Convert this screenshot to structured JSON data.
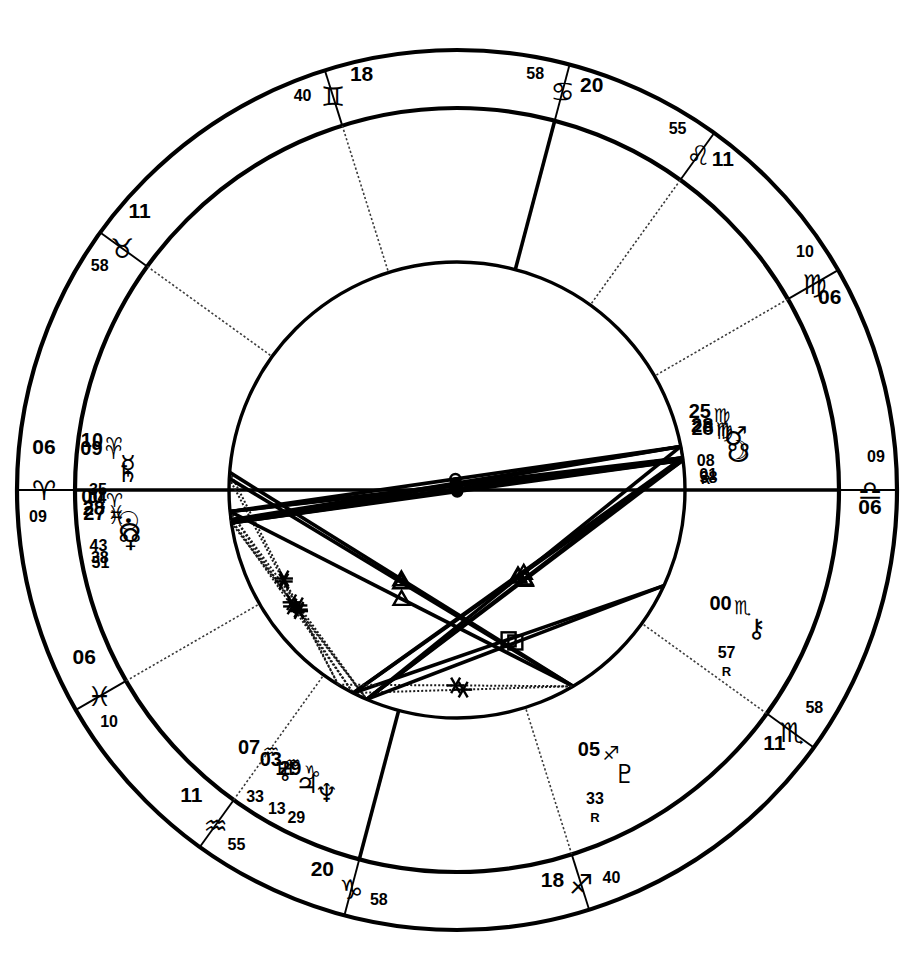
{
  "chart": {
    "type": "astrological-wheel",
    "line_color": "#000000",
    "background": "#ffffff"
  },
  "chart_data": {
    "type": "astrology-wheel",
    "house_cusps": [
      {
        "house": 1,
        "deg": "06",
        "sign": "♎",
        "sign_name": "Libra",
        "min": "09",
        "angle_deg": 186.15,
        "label_pos": "bottom"
      },
      {
        "house": 2,
        "deg": "11",
        "sign": "♏",
        "sign_name": "Scorpio",
        "min": "58",
        "angle_deg": 221.97,
        "label_pos": "bottom-right"
      },
      {
        "house": 3,
        "deg": "18",
        "sign": "♐",
        "sign_name": "Sagittarius",
        "min": "40",
        "angle_deg": 258.67,
        "label_pos": "right-lower"
      },
      {
        "house": 4,
        "deg": "20",
        "sign": "♑",
        "sign_name": "Capricorn",
        "min": "58",
        "angle_deg": 290.97,
        "label_pos": "right"
      },
      {
        "house": 5,
        "deg": "11",
        "sign": "♒",
        "sign_name": "Aquarius",
        "min": "55",
        "angle_deg": 311.92,
        "label_pos": "right-upper"
      },
      {
        "house": 6,
        "deg": "06",
        "sign": "♓",
        "sign_name": "Pisces",
        "min": "10",
        "angle_deg": 336.17,
        "label_pos": "top-right"
      },
      {
        "house": 7,
        "deg": "06",
        "sign": "♈",
        "sign_name": "Aries",
        "min": "09",
        "angle_deg": 6.15,
        "label_pos": "top"
      },
      {
        "house": 8,
        "deg": "11",
        "sign": "♉",
        "sign_name": "Taurus",
        "min": "58",
        "angle_deg": 41.97,
        "label_pos": "top-left"
      },
      {
        "house": 9,
        "deg": "18",
        "sign": "♊",
        "sign_name": "Gemini",
        "min": "40",
        "angle_deg": 78.67,
        "label_pos": "left-upper"
      },
      {
        "house": 10,
        "deg": "20",
        "sign": "♋",
        "sign_name": "Cancer",
        "min": "58",
        "angle_deg": 110.97,
        "label_pos": "left"
      },
      {
        "house": 11,
        "deg": "11",
        "sign": "♌",
        "sign_name": "Leo",
        "min": "55",
        "angle_deg": 131.92,
        "label_pos": "left-lower"
      },
      {
        "house": 12,
        "deg": "06",
        "sign": "♍",
        "sign_name": "Virgo",
        "min": "10",
        "angle_deg": 156.17,
        "label_pos": "bottom-left"
      }
    ],
    "planets": [
      {
        "name": "Mercury",
        "glyph": "☿",
        "deg": "10",
        "sign": "♈",
        "sign_name": "Aries",
        "min": "35",
        "retro": "",
        "lon": 10.58
      },
      {
        "name": "Saturn",
        "glyph": "♄",
        "deg": "09",
        "sign": "♈",
        "sign_name": "Aries",
        "min": "04",
        "retro": "",
        "lon": 9.07
      },
      {
        "name": "Sun",
        "glyph": "☉",
        "deg": "00",
        "sign": "♈",
        "sign_name": "Aries",
        "min": "43",
        "retro": "",
        "lon": 0.72
      },
      {
        "name": "North Node",
        "glyph": "☊",
        "deg": "28",
        "sign": "♓",
        "sign_name": "Pisces",
        "min": "38",
        "retro": "",
        "lon": 358.63
      },
      {
        "name": "Venus",
        "glyph": "♀",
        "deg": "27",
        "sign": "♓",
        "sign_name": "Pisces",
        "min": "51",
        "retro": "",
        "lon": 357.85
      },
      {
        "name": "Jupiter",
        "glyph": "♃",
        "deg": "03",
        "sign": "♒",
        "sign_name": "Aquarius",
        "min": "13",
        "retro": "",
        "lon": 303.22
      },
      {
        "name": "Uranus",
        "glyph": "♅",
        "deg": "07",
        "sign": "♒",
        "sign_name": "Aquarius",
        "min": "33",
        "retro": "",
        "lon": 307.55
      },
      {
        "name": "Neptune",
        "glyph": "♆",
        "deg": "29",
        "sign": "♑",
        "sign_name": "Capricorn",
        "min": "29",
        "retro": "",
        "lon": 299.48
      },
      {
        "name": "Pluto",
        "glyph": "♇",
        "deg": "05",
        "sign": "♐",
        "sign_name": "Sagittarius",
        "min": "33",
        "retro": "R",
        "lon": 245.55
      },
      {
        "name": "Chiron",
        "glyph": "⚷",
        "deg": "00",
        "sign": "♏",
        "sign_name": "Scorpio",
        "min": "57",
        "retro": "R",
        "lon": 210.95
      },
      {
        "name": "Mars",
        "glyph": "♂",
        "deg": "25",
        "sign": "♍",
        "sign_name": "Virgo",
        "min": "08",
        "retro": "R",
        "lon": 175.13
      },
      {
        "name": "South Node",
        "glyph": "☋",
        "deg": "28",
        "sign": "♍",
        "sign_name": "Virgo",
        "min": "38",
        "retro": "",
        "lon": 178.63
      },
      {
        "name": "Moon",
        "glyph": "☽",
        "deg": "28",
        "sign": "♍",
        "sign_name": "Virgo",
        "min": "01",
        "retro": "",
        "lon": 178.02
      }
    ],
    "aspect_glyphs": [
      {
        "name": "conjunction",
        "glyph": "☌"
      },
      {
        "name": "sextile",
        "glyph": "✳"
      },
      {
        "name": "square",
        "glyph": "□"
      },
      {
        "name": "trine",
        "glyph": "△"
      },
      {
        "name": "opposition",
        "glyph": "☍"
      }
    ],
    "rings": {
      "outer_r": 440,
      "zodiac_inner_r": 382,
      "house_r": 228
    },
    "center": {
      "x": 457,
      "y": 490
    }
  }
}
